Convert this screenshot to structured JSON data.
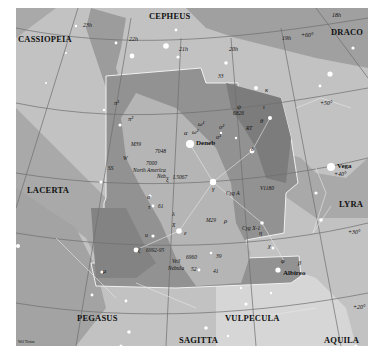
{
  "map": {
    "title": "Cygnus star chart",
    "colors": {
      "background": "#a9a9a9",
      "milky_way_light": "#c8c8c8",
      "milky_way_bright": "#d9d9d9",
      "constellation_region": "#8f8f8f",
      "dark_rift": "#7a7a7a",
      "boundary": "#f2f2f2",
      "grid": "#6e6e6e"
    },
    "constellations": [
      {
        "name": "CASSIOPEIA",
        "x": 2,
        "y": 27
      },
      {
        "name": "CEPHEUS",
        "x": 133,
        "y": 4
      },
      {
        "name": "DRACO",
        "x": 315,
        "y": 20
      },
      {
        "name": "LACERTA",
        "x": 11,
        "y": 178
      },
      {
        "name": "LYRA",
        "x": 323,
        "y": 192
      },
      {
        "name": "PEGASUS",
        "x": 61,
        "y": 306
      },
      {
        "name": "VULPECULA",
        "x": 209,
        "y": 306
      },
      {
        "name": "SAGITTA",
        "x": 163,
        "y": 328
      },
      {
        "name": "AQUILA",
        "x": 308,
        "y": 328
      }
    ],
    "ra_labels": [
      {
        "text": "23h",
        "x": 67,
        "y": 14
      },
      {
        "text": "22h",
        "x": 113,
        "y": 28
      },
      {
        "text": "21h",
        "x": 163,
        "y": 38
      },
      {
        "text": "20h",
        "x": 213,
        "y": 38
      },
      {
        "text": "19h",
        "x": 266,
        "y": 27
      },
      {
        "text": "18h",
        "x": 316,
        "y": 4
      }
    ],
    "dec_labels": [
      {
        "text": "+60°",
        "x": 285,
        "y": 24
      },
      {
        "text": "+50°",
        "x": 304,
        "y": 92
      },
      {
        "text": "+40°",
        "x": 318,
        "y": 163
      },
      {
        "text": "+30°",
        "x": 332,
        "y": 221
      },
      {
        "text": "+20°",
        "x": 337,
        "y": 296
      }
    ],
    "named_stars": [
      {
        "name": "Deneb",
        "x": 190,
        "y": 152
      },
      {
        "name": "Vega",
        "x": 331,
        "y": 167
      },
      {
        "name": "Albireo",
        "x": 279,
        "y": 267
      }
    ],
    "greek_labels": [
      {
        "text": "κ",
        "x": 265,
        "y": 87
      },
      {
        "text": "ι",
        "x": 263,
        "y": 104
      },
      {
        "text": "θ",
        "x": 260,
        "y": 118
      },
      {
        "text": "ψ",
        "x": 237,
        "y": 104
      },
      {
        "text": "δ",
        "x": 251,
        "y": 146
      },
      {
        "text": "α",
        "x": 184,
        "y": 142
      },
      {
        "text": "γ",
        "x": 212,
        "y": 178
      },
      {
        "text": "ω¹",
        "x": 188,
        "y": 121
      },
      {
        "text": "ω²",
        "x": 195,
        "y": 132
      },
      {
        "text": "ο¹",
        "x": 216,
        "y": 134
      },
      {
        "text": "ο²",
        "x": 220,
        "y": 124
      },
      {
        "text": "π¹",
        "x": 114,
        "y": 100
      },
      {
        "text": "π²",
        "x": 104,
        "y": 114
      },
      {
        "text": "ξ",
        "x": 166,
        "y": 164
      },
      {
        "text": "σ",
        "x": 147,
        "y": 191
      },
      {
        "text": "τ",
        "x": 148,
        "y": 201
      },
      {
        "text": "υ",
        "x": 145,
        "y": 226
      },
      {
        "text": "λ",
        "x": 172,
        "y": 207
      },
      {
        "text": "ε",
        "x": 179,
        "y": 229
      },
      {
        "text": "ζ",
        "x": 136,
        "y": 250
      },
      {
        "text": "μ",
        "x": 103,
        "y": 265
      },
      {
        "text": "η",
        "x": 247,
        "y": 221
      },
      {
        "text": "χ",
        "x": 257,
        "y": 236
      },
      {
        "text": "φ",
        "x": 273,
        "y": 253
      },
      {
        "text": "β",
        "x": 285,
        "y": 253
      },
      {
        "text": "ρ",
        "x": 168,
        "y": 192
      }
    ],
    "catalog_labels": [
      {
        "text": "M39",
        "x": 131,
        "y": 134
      },
      {
        "text": "7048",
        "x": 155,
        "y": 141
      },
      {
        "text": "7000",
        "x": 146,
        "y": 155
      },
      {
        "text": "North America",
        "x": 133,
        "y": 162
      },
      {
        "text": "Neb.",
        "x": 157,
        "y": 169
      },
      {
        "text": "I.5067",
        "x": 173,
        "y": 170
      },
      {
        "text": "M29",
        "x": 195,
        "y": 202
      },
      {
        "text": "6826",
        "x": 247,
        "y": 111
      },
      {
        "text": "RT",
        "x": 247,
        "y": 126
      },
      {
        "text": "Cyg A",
        "x": 226,
        "y": 183
      },
      {
        "text": "V1180",
        "x": 251,
        "y": 183
      },
      {
        "text": "Cyg X-1",
        "x": 247,
        "y": 222
      },
      {
        "text": "6992-95",
        "x": 130,
        "y": 245
      },
      {
        "text": "Veil",
        "x": 149,
        "y": 254
      },
      {
        "text": "Nebula",
        "x": 145,
        "y": 261
      },
      {
        "text": "6960",
        "x": 163,
        "y": 252
      },
      {
        "text": "W",
        "x": 96,
        "y": 138
      },
      {
        "text": "SS",
        "x": 86,
        "y": 146
      },
      {
        "text": "X",
        "x": 172,
        "y": 216
      }
    ],
    "numbered_stars": [
      {
        "text": "33",
        "x": 218,
        "y": 84
      },
      {
        "text": "61",
        "x": 150,
        "y": 194
      },
      {
        "text": "39",
        "x": 201,
        "y": 246
      },
      {
        "text": "52",
        "x": 166,
        "y": 260
      },
      {
        "text": "41",
        "x": 188,
        "y": 262
      }
    ],
    "credit": "Wil Tirion"
  }
}
